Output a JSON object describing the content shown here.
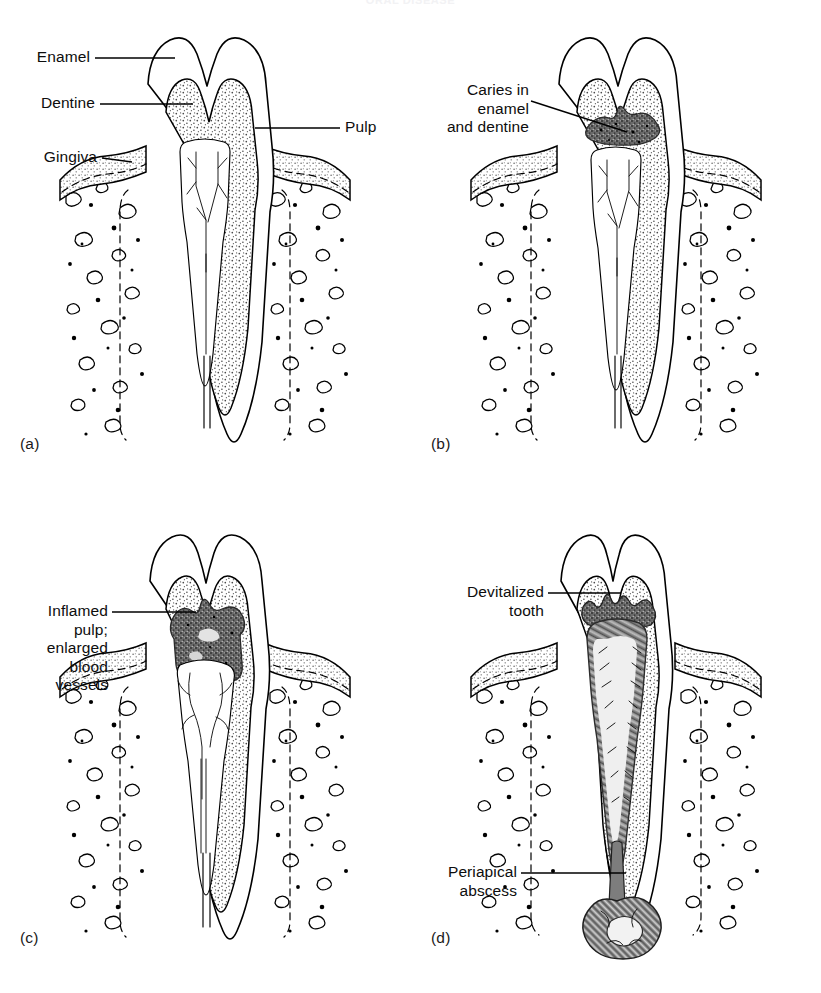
{
  "document": {
    "running_head": "ORAL DISEASE",
    "figure_type": "line-art anatomical diagram",
    "layout": "2x2 grid of four labelled tooth cross-sections",
    "caption_letters": [
      "(a)",
      "(b)",
      "(c)",
      "(d)"
    ],
    "background_color": "#ffffff",
    "ink_color": "#000000",
    "lesion_fill_color": "#6a6a6a",
    "stipple_color": "#555555",
    "bone_chip_color": "#8e8e8e"
  },
  "panels": [
    {
      "letter": "(a)",
      "name": "healthy-tooth",
      "labels": [
        {
          "text": "Enamel",
          "align": "right"
        },
        {
          "text": "Dentine",
          "align": "right"
        },
        {
          "text": "Gingiva",
          "align": "right"
        },
        {
          "text": "Pulp",
          "align": "left"
        }
      ]
    },
    {
      "letter": "(b)",
      "name": "caries-in-enamel-and-dentine",
      "labels": [
        {
          "text": "Caries in\nenamel\nand dentine",
          "align": "right"
        }
      ]
    },
    {
      "letter": "(c)",
      "name": "inflamed-pulp",
      "labels": [
        {
          "text": "Inflamed\npulp;\nenlarged\nblood\nvessels",
          "align": "right"
        }
      ]
    },
    {
      "letter": "(d)",
      "name": "devitalized-tooth-with-periapical-abscess",
      "labels": [
        {
          "text": "Devitalized\ntooth",
          "align": "right"
        },
        {
          "text": "Periapical\nabscess",
          "align": "right"
        }
      ]
    }
  ]
}
